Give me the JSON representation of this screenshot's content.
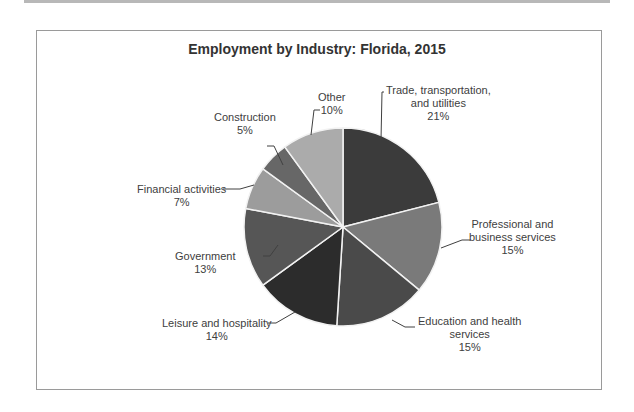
{
  "chart_data": {
    "type": "pie",
    "title": "Employment by Industry: Florida, 2015",
    "categories": [
      "Trade, transportation, and utilities",
      "Professional and business services",
      "Education and health services",
      "Leisure and hospitality",
      "Government",
      "Financial activities",
      "Construction",
      "Other"
    ],
    "values": [
      21,
      15,
      15,
      14,
      13,
      7,
      5,
      10
    ],
    "value_labels": [
      "21%",
      "15%",
      "15%",
      "14%",
      "13%",
      "7%",
      "5%",
      "10%"
    ],
    "colors": [
      "#3b3b3b",
      "#7a7a7a",
      "#4a4a4a",
      "#2c2c2c",
      "#565656",
      "#9c9c9c",
      "#676767",
      "#ababab"
    ],
    "start_angle_deg": 0,
    "direction": "clockwise",
    "legend": "none (data labels with leader lines)",
    "label_lines": {
      "trade": [
        "Trade, transportation,",
        "and utilities"
      ],
      "professional": [
        "Professional and",
        "business services"
      ],
      "education": [
        "Education and health",
        "services"
      ],
      "leisure": [
        "Leisure and hospitality"
      ],
      "government": [
        "Government"
      ],
      "financial": [
        "Financial activities"
      ],
      "construction": [
        "Construction"
      ],
      "other": [
        "Other"
      ]
    }
  }
}
